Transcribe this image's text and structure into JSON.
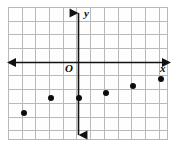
{
  "chart_data": {
    "type": "scatter",
    "title": "",
    "xlabel": "x",
    "ylabel": "y",
    "origin_label": "O",
    "grid": true,
    "legend": "none",
    "xlim": [
      -5,
      7
    ],
    "ylim": [
      -5.5,
      4
    ],
    "x_tick_step": 1,
    "y_tick_step": 1,
    "x": [
      -4,
      -2,
      0,
      2,
      4,
      6
    ],
    "y": [
      -3.7,
      -2.6,
      -2.6,
      -2.2,
      -1.7,
      -1.2
    ],
    "points": [
      {
        "label": "point-1",
        "x": -4,
        "y": -3.7
      },
      {
        "label": "point-2",
        "x": -2,
        "y": -2.6
      },
      {
        "label": "point-3",
        "x": 0,
        "y": -2.6
      },
      {
        "label": "point-4",
        "x": 2,
        "y": -2.2
      },
      {
        "label": "point-5",
        "x": 4,
        "y": -1.7
      },
      {
        "label": "point-6",
        "x": 6,
        "y": -1.2
      }
    ],
    "point_color": "#0d0d0d",
    "axis_color": "#111111",
    "grid_color": "#b9b9b9"
  },
  "axes": {
    "x_label": "x",
    "y_label": "y",
    "origin_label": "O"
  }
}
